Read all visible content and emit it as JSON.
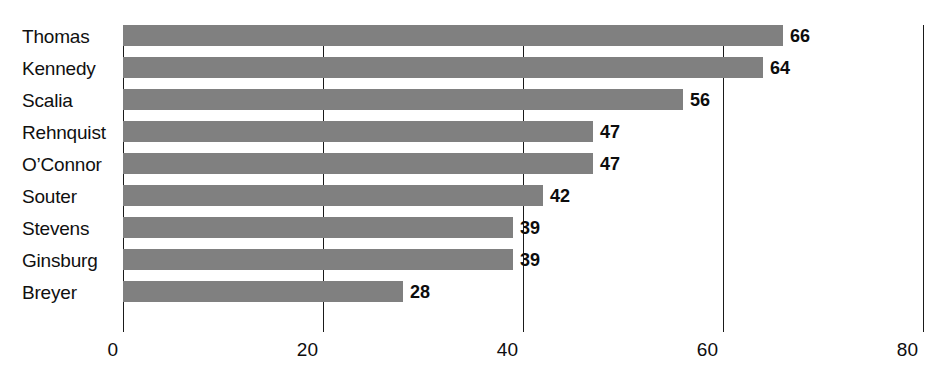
{
  "chart_data": {
    "type": "bar",
    "orientation": "horizontal",
    "title": "",
    "subtitle": "",
    "xlabel": "",
    "ylabel": "",
    "categories": [
      "Thomas",
      "Kennedy",
      "Scalia",
      "Rehnquist",
      "O’Connor",
      "Souter",
      "Stevens",
      "Ginsburg",
      "Breyer"
    ],
    "values": [
      66,
      64,
      56,
      47,
      47,
      42,
      39,
      39,
      28
    ],
    "value_labels": [
      "66",
      "64",
      "56",
      "47",
      "47",
      "42",
      "39",
      "39",
      "28"
    ],
    "xlim": [
      0,
      80
    ],
    "xticks": [
      0,
      20,
      40,
      60,
      80
    ],
    "xtick_labels": [
      "0",
      "20",
      "40",
      "60",
      "80"
    ],
    "grid": "vertical-only",
    "legend": "none",
    "series": [
      {
        "name": "",
        "values": [
          66,
          64,
          56,
          47,
          47,
          42,
          39,
          39,
          28
        ]
      }
    ],
    "colors": {
      "bar_fill": "#808080",
      "gridline": "#1a1a1a",
      "text": "#101010",
      "background": "#ffffff"
    }
  }
}
